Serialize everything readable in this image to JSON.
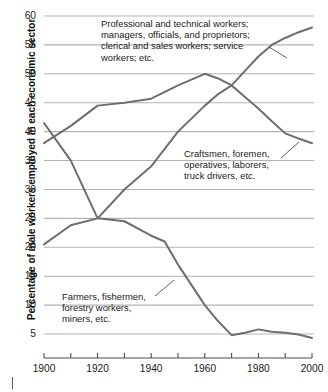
{
  "chart_data": {
    "type": "line",
    "title": "",
    "xlabel": "",
    "ylabel": "Percentage of male workers employed in each economic sector",
    "xlim": [
      1900,
      2000
    ],
    "ylim": [
      0,
      60
    ],
    "grid": true,
    "legend_position": "inline-annotations",
    "x_ticks": [
      1900,
      1920,
      1940,
      1960,
      1980,
      2000
    ],
    "x_minor_ticks": [
      1910,
      1930,
      1950,
      1970,
      1990
    ],
    "y_ticks": [
      5,
      10,
      15,
      20,
      25,
      30,
      35,
      40,
      45,
      50,
      55,
      60
    ],
    "series": [
      {
        "name": "Professional and technical workers; managers, officials, and proprietors; clerical and sales workers; service workers; etc.",
        "color": "#6e6e6e",
        "x": [
          1900,
          1910,
          1920,
          1930,
          1940,
          1950,
          1960,
          1965,
          1970,
          1975,
          1980,
          1985,
          1990,
          1995,
          2000
        ],
        "values": [
          20.5,
          23.8,
          25.0,
          30.0,
          34.0,
          40.0,
          44.5,
          46.5,
          48.0,
          50.5,
          53.0,
          55.0,
          56.2,
          57.2,
          58.0
        ]
      },
      {
        "name": "Craftsmen, foremen, operatives, laborers, truck drivers, etc.",
        "color": "#6e6e6e",
        "x": [
          1900,
          1910,
          1920,
          1930,
          1940,
          1950,
          1960,
          1965,
          1970,
          1975,
          1980,
          1985,
          1990,
          1995,
          2000
        ],
        "values": [
          38.0,
          41.0,
          44.5,
          45.0,
          45.7,
          48.0,
          50.0,
          49.2,
          48.0,
          46.0,
          44.0,
          41.8,
          39.7,
          38.8,
          38.0
        ]
      },
      {
        "name": "Farmers, fishermen, forestry workers, miners, etc.",
        "color": "#6e6e6e",
        "x": [
          1900,
          1910,
          1920,
          1930,
          1940,
          1945,
          1950,
          1955,
          1960,
          1965,
          1970,
          1975,
          1980,
          1985,
          1990,
          1995,
          2000
        ],
        "values": [
          41.5,
          35.0,
          25.0,
          24.5,
          22.0,
          21.0,
          17.0,
          13.5,
          10.0,
          7.2,
          4.8,
          5.2,
          5.8,
          5.4,
          5.2,
          4.9,
          4.3
        ]
      }
    ],
    "annotations": [
      {
        "id": "professional",
        "text": "Professional and technical workers;\nmanagers, officials, and proprietors;\nclerical and sales workers; service\nworkers; etc."
      },
      {
        "id": "craftsmen",
        "text": "Craftsmen, foremen,\noperatives, laborers,\ntruck drivers, etc."
      },
      {
        "id": "farmers",
        "text": "Farmers, fishermen,\nforestry workers,\nminers, etc."
      }
    ],
    "colors": {
      "line": "#6e6e6e",
      "grid": "#b3b3b3",
      "axis": "#4d4d4d",
      "text": "#1a1a1a",
      "background": "#ffffff"
    }
  },
  "y_tick_labels": [
    "60",
    "55",
    "50",
    "45",
    "40",
    "35",
    "30",
    "25",
    "20",
    "15",
    "10",
    "5"
  ],
  "x_tick_labels": [
    "1900",
    "1920",
    "1940",
    "1960",
    "1980",
    "2000"
  ]
}
